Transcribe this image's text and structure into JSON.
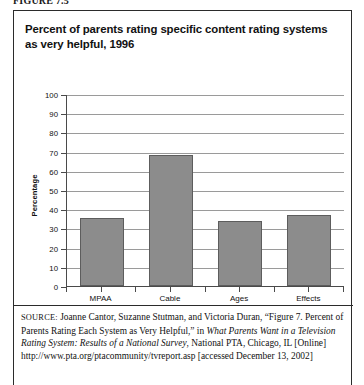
{
  "figure": {
    "label": "FIGURE 7.5"
  },
  "chart_title": "Percent of parents rating specific content rating systems as very helpful, 1996",
  "chart_data": {
    "type": "bar",
    "title": "Percent of parents rating specific content rating systems as very helpful, 1996",
    "categories": [
      "MPAA",
      "Cable",
      "Ages",
      "Effects"
    ],
    "values": [
      35.5,
      68,
      34,
      37
    ],
    "xlabel": "",
    "ylabel": "Percentage",
    "ylim": [
      0,
      100
    ],
    "yticks": [
      0,
      10,
      20,
      30,
      40,
      50,
      60,
      70,
      80,
      90,
      100
    ],
    "ytick_labels": [
      "0",
      "10",
      "20",
      "30",
      "40",
      "50",
      "60",
      "70",
      "80",
      "90",
      "100"
    ],
    "grid": true,
    "legend": false,
    "bar_color": "#8c8c8c",
    "bar_edge_color": "#5d5d5d",
    "axis_color": "#4a4a4a",
    "gridline_color": "#9a9a9a"
  },
  "source": {
    "kicker": "SOURCE:",
    "text_1": " Joanne Cantor, Suzanne Stutman, and Victoria Duran, “Figure 7. Percent of Parents Rating Each System as Very Helpful,” in ",
    "italic_1": "What Parents Want in a Television Rating System: Results of a National Survey",
    "text_2": ", National PTA, Chicago, IL [Online] http://www.pta.org/ptacommunity/tvreport.asp [accessed December 13, 2002]"
  }
}
